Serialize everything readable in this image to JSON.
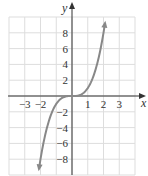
{
  "chart_data": {
    "type": "line",
    "title": "",
    "function": "y = x^3",
    "xlabel": "x",
    "ylabel": "y",
    "xlim": [
      -4,
      4
    ],
    "ylim": [
      -10,
      10
    ],
    "grid": true,
    "x_ticks": [
      -3,
      -2,
      1,
      2,
      3
    ],
    "x_tick_labels": [
      "−3",
      "−2",
      "1",
      "2",
      "3"
    ],
    "y_ticks": [
      8,
      6,
      4,
      2,
      -2,
      -4,
      -6,
      -8
    ],
    "y_tick_labels": [
      "8",
      "6",
      "4",
      "2",
      "−2",
      "−4",
      "−6",
      "−8"
    ],
    "series": [
      {
        "name": "y = x^3",
        "x": [
          -2.1,
          -2,
          -1.5,
          -1,
          -0.5,
          0,
          0.5,
          1,
          1.5,
          2,
          2.1
        ],
        "y": [
          -9.26,
          -8,
          -3.375,
          -1,
          -0.125,
          0,
          0.125,
          1,
          3.375,
          8,
          9.26
        ],
        "arrows_at_ends": true
      }
    ]
  },
  "colors": {
    "grid": "#dddddd",
    "axis": "#333333",
    "curve": "#888888"
  }
}
